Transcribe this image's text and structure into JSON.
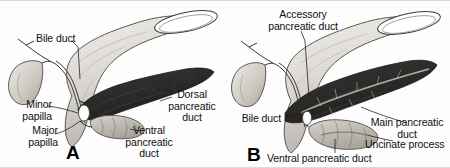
{
  "figure": {
    "type": "anatomical-illustration",
    "style": "grayscale pen-and-ink textbook drawing",
    "background_color": "#fdfdfd",
    "ink_color": "#101010",
    "pancreas_fill": "#2e2d2b",
    "duodenum_fill": "#d9d6d1",
    "gallbladder_fill": "#cfcbc4"
  },
  "panels": [
    {
      "letter": "A",
      "name": "panel-a",
      "labels": [
        {
          "id": "bile-duct",
          "text": "Bile duct"
        },
        {
          "id": "minor-papilla",
          "text": "Minor\npapilla"
        },
        {
          "id": "major-papilla",
          "text": "Major\npapilla"
        },
        {
          "id": "dorsal-pancreatic-duct",
          "text": "Dorsal\npancreatic\nduct"
        },
        {
          "id": "ventral-pancreatic-duct",
          "text": "Ventral\npancreatic\nduct"
        }
      ],
      "structures": [
        "duodenum",
        "gallbladder",
        "cystic duct",
        "common bile duct",
        "dorsal pancreas",
        "ventral pancreas"
      ]
    },
    {
      "letter": "B",
      "name": "panel-b",
      "labels": [
        {
          "id": "accessory-pancreatic-duct",
          "text": "Accessory\npancreatic duct"
        },
        {
          "id": "bile-duct",
          "text": "Bile duct"
        },
        {
          "id": "main-pancreatic-duct",
          "text": "Main pancreatic\nduct"
        },
        {
          "id": "uncinate-process",
          "text": "Uncinate process"
        },
        {
          "id": "ventral-pancreatic-duct",
          "text": "Ventral pancreatic duct"
        }
      ],
      "structures": [
        "duodenum",
        "gallbladder",
        "cystic duct",
        "common bile duct",
        "pancreas body and tail",
        "uncinate process"
      ]
    }
  ]
}
